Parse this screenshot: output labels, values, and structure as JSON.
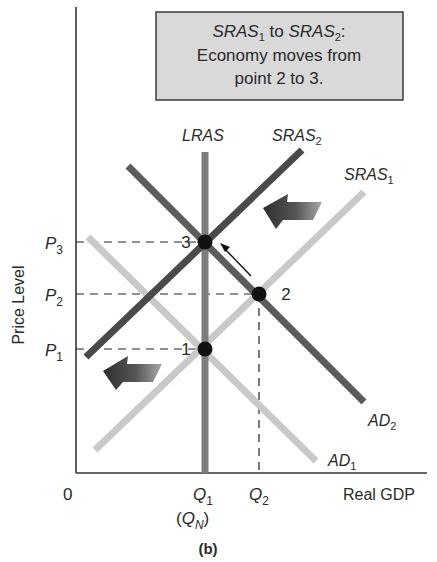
{
  "annotation_box": {
    "line1_a": "SRAS",
    "line1_a_sub": "1",
    "line1_mid": " to ",
    "line1_b": "SRAS",
    "line1_b_sub": "2",
    "line1_end": ":",
    "line2": "Economy moves from",
    "line3": "point 2 to 3."
  },
  "curves": {
    "lras": {
      "label": "LRAS",
      "sub": ""
    },
    "sras2": {
      "label": "SRAS",
      "sub": "2"
    },
    "sras1": {
      "label": "SRAS",
      "sub": "1"
    },
    "ad2": {
      "label": "AD",
      "sub": "2"
    },
    "ad1": {
      "label": "AD",
      "sub": "1"
    }
  },
  "y_axis": {
    "title": "Price Level",
    "ticks": [
      {
        "label": "P",
        "sub": "3"
      },
      {
        "label": "P",
        "sub": "2"
      },
      {
        "label": "P",
        "sub": "1"
      }
    ]
  },
  "x_axis": {
    "title": "Real GDP",
    "origin": "0",
    "ticks": [
      {
        "label": "Q",
        "sub": "1",
        "note_open": "(",
        "note": "Q",
        "note_sub": "N",
        "note_close": ")"
      },
      {
        "label": "Q",
        "sub": "2"
      }
    ]
  },
  "points": [
    {
      "label": "1"
    },
    {
      "label": "2"
    },
    {
      "label": "3"
    }
  ],
  "caption": "(b)",
  "colors": {
    "box_fill": "#d9d9d9",
    "box_border": "#3a3a3a",
    "lras": "#7d7d7d",
    "sras2": "#4a4a4a",
    "ad2": "#5c5c5c",
    "sras1": "#c9c9c9",
    "ad1": "#c9c9c9",
    "axis": "#333333",
    "point": "#111111"
  }
}
